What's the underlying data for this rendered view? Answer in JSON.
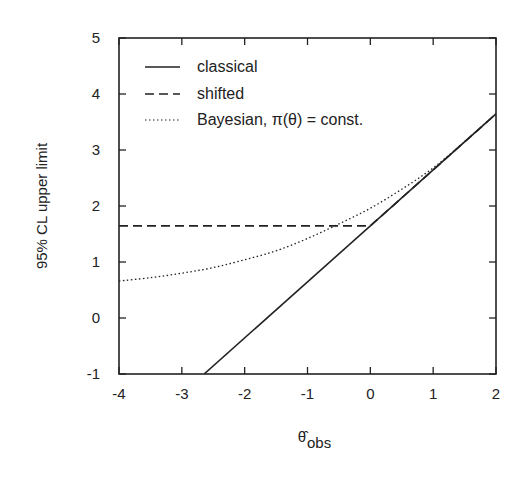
{
  "chart_data": {
    "type": "line",
    "title": "",
    "xlabel": "θ̂_obs",
    "ylabel": "95% CL upper limit",
    "xlim": [
      -4,
      2
    ],
    "ylim": [
      -1,
      5
    ],
    "xticks": [
      -4,
      -3,
      -2,
      -1,
      0,
      1,
      2
    ],
    "yticks": [
      -1,
      0,
      1,
      2,
      3,
      4,
      5
    ],
    "grid": false,
    "legend_position": "upper left",
    "series": [
      {
        "name": "classical",
        "style": "solid",
        "x": [
          -2.645,
          2
        ],
        "y": [
          -1,
          3.645
        ]
      },
      {
        "name": "shifted",
        "style": "dashed",
        "x": [
          -4,
          0,
          2
        ],
        "y": [
          1.645,
          1.645,
          3.645
        ]
      },
      {
        "name": "Bayesian, π(θ) = const.",
        "style": "dotted",
        "x": [
          -4,
          -3.5,
          -3,
          -2.5,
          -2,
          -1.5,
          -1,
          -0.5,
          0,
          0.5,
          1,
          1.5,
          2
        ],
        "y": [
          0.66,
          0.72,
          0.8,
          0.9,
          1.04,
          1.2,
          1.42,
          1.68,
          1.96,
          2.3,
          2.68,
          3.15,
          3.65
        ]
      }
    ]
  },
  "legend": [
    "classical",
    "shifted",
    "Bayesian, π(θ) = const."
  ],
  "axis": {
    "ylabel": "95% CL upper limit",
    "xlabel_main": "θ̂",
    "xlabel_sub": "obs"
  }
}
